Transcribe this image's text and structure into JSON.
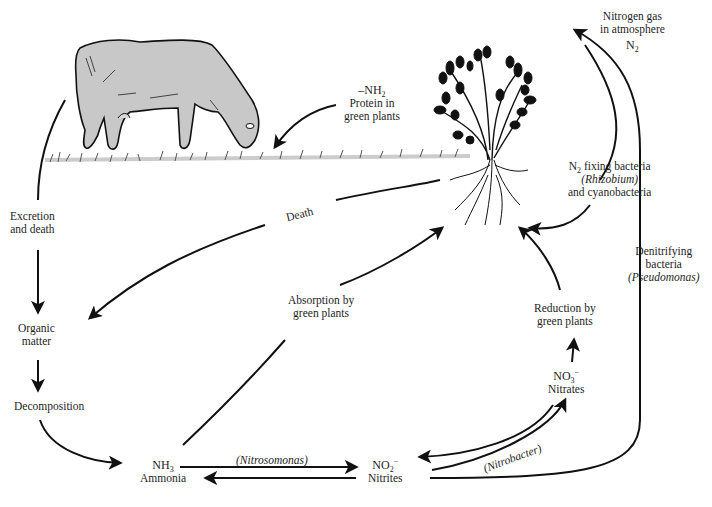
{
  "diagram": {
    "labels": {
      "n2_atmosphere_l1": "Nitrogen gas",
      "n2_atmosphere_l2": "in atmosphere",
      "n2_formula": "N",
      "n2_sub": "2",
      "protein_formula": "–NH",
      "protein_sub": "2",
      "protein_l1": "Protein in",
      "protein_l2": "green plants",
      "fixing_l1_pre": "N",
      "fixing_l1_sub": "2",
      "fixing_l1_post": " fixing bacteria",
      "fixing_l2": "(Rhizobium)",
      "fixing_l3": "and cyanobacteria",
      "denit_l1": "Denitrifying",
      "denit_l2": "bacteria",
      "denit_l3": "(Pseudomonas)",
      "excretion_l1": "Excretion",
      "excretion_l2": "and death",
      "death": "Death",
      "organic_l1": "Organic",
      "organic_l2": "matter",
      "decomposition": "Decomposition",
      "absorption_l1": "Absorption by",
      "absorption_l2": "green plants",
      "reduction_l1": "Reduction by",
      "reduction_l2": "green plants",
      "nh3_formula": "NH",
      "nh3_sub": "3",
      "nh3_name": "Ammonia",
      "nitrosomonas": "(Nitrosomonas)",
      "no2_formula": "NO",
      "no2_sub": "2",
      "no2_sup": "−",
      "no2_name": "Nitrites",
      "no3_formula": "NO",
      "no3_sub": "3",
      "no3_sup": "−",
      "no3_name": "Nitrates",
      "nitrobacter": "(Nitrobacter)"
    },
    "colors": {
      "stroke": "#111111",
      "cow_fill": "#c8c8c8",
      "grass": "#555555"
    }
  }
}
